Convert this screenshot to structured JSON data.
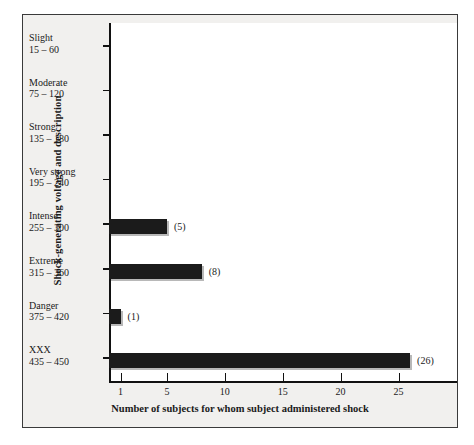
{
  "chart_data": {
    "type": "bar",
    "orientation": "horizontal",
    "title": "",
    "xlabel": "Number of subjects for whom subject administered shock",
    "ylabel": "Shock-generating voltage and description",
    "categories": [
      {
        "name": "Slight",
        "range": "15 – 60"
      },
      {
        "name": "Moderate",
        "range": "75 – 120"
      },
      {
        "name": "Strong",
        "range": "135 – 180"
      },
      {
        "name": "Very strong",
        "range": "195 – 240"
      },
      {
        "name": "Intense",
        "range": "255 – 300"
      },
      {
        "name": "Extreme",
        "range": "315 – 360"
      },
      {
        "name": "Danger",
        "range": "375 – 420"
      },
      {
        "name": "XXX",
        "range": "435 – 450"
      }
    ],
    "values": [
      0,
      0,
      0,
      0,
      5,
      8,
      1,
      26
    ],
    "value_labels": [
      "",
      "",
      "",
      "",
      "(5)",
      "(8)",
      "(1)",
      "(26)"
    ],
    "xticks": [
      1,
      5,
      10,
      15,
      20,
      25
    ],
    "xticklabels": [
      "1",
      "5",
      "10",
      "15",
      "20",
      "25"
    ],
    "xlim": [
      0,
      30
    ],
    "grid": false,
    "legend": null,
    "bar_color": "#1b1b1b",
    "background_color": "#f1f0ee",
    "plot_background_color": "#ffffff",
    "axis_color": "#111111"
  }
}
